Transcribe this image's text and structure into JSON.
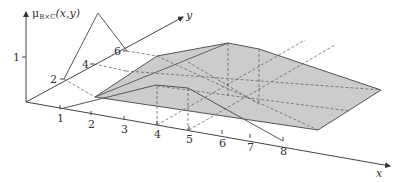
{
  "figure": {
    "axes": {
      "mu_label": "μ",
      "mu_sub": "B×C",
      "mu_args": "(x,y)",
      "x_label": "x",
      "y_label": "y",
      "mu_ticks": [
        "1"
      ],
      "x_ticks": [
        "1",
        "2",
        "3",
        "4",
        "5",
        "6",
        "7",
        "8"
      ],
      "y_ticks": [
        "2",
        "4",
        "6"
      ]
    },
    "sets": {
      "B": {
        "axis": "x",
        "support": [
          1,
          8
        ],
        "core": [
          4,
          5
        ],
        "shape": "trapezoid"
      },
      "C": {
        "axis": "y",
        "support": [
          2,
          6
        ],
        "core": [
          4,
          4
        ],
        "shape": "triangle"
      }
    },
    "colors": {
      "surface_fill": "#cccccc",
      "line": "#555555",
      "dashed": "#666666",
      "background": "#ffffff"
    }
  }
}
